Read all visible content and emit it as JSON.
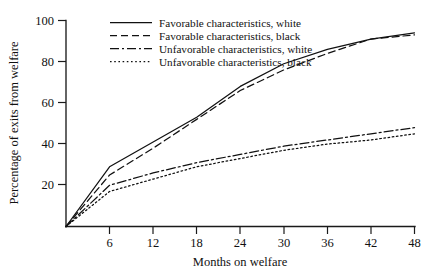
{
  "chart_data": {
    "type": "line",
    "title": "",
    "subtitle": "",
    "xlabel": "Months on welfare",
    "ylabel": "Percentage of exits from welfare",
    "x": [
      0,
      6,
      12,
      18,
      24,
      30,
      36,
      42,
      48
    ],
    "xticks": [
      6,
      12,
      18,
      24,
      30,
      36,
      42,
      48
    ],
    "yticks": [
      20,
      40,
      60,
      80,
      100
    ],
    "xlim": [
      0,
      48
    ],
    "ylim": [
      0,
      100
    ],
    "grid": false,
    "legend_position": "top-left-inside",
    "series": [
      {
        "name": "Favorable characteristics, white",
        "dash": "solid",
        "values": [
          0,
          29,
          41,
          53,
          68,
          79,
          86,
          91,
          94
        ]
      },
      {
        "name": "Favorable characteristics, black",
        "dash": "dashed",
        "values": [
          0,
          25,
          38,
          52,
          66,
          76,
          84,
          91,
          93
        ]
      },
      {
        "name": "Unfavorable characteristics, white",
        "dash": "dash-dot",
        "values": [
          0,
          20,
          26,
          31,
          35,
          39,
          42,
          45,
          48
        ]
      },
      {
        "name": "Unfavorable characteristics, black",
        "dash": "dotted",
        "values": [
          0,
          17,
          23,
          29,
          33,
          37,
          40,
          42,
          45
        ]
      }
    ]
  },
  "axes": {
    "y_title": "Percentage of exits from welfare",
    "x_title": "Months on welfare",
    "y_tick_labels": [
      "100",
      "80",
      "60",
      "40",
      "20"
    ],
    "x_tick_labels": [
      "6",
      "12",
      "18",
      "24",
      "30",
      "36",
      "42",
      "48"
    ]
  },
  "legend": {
    "items": [
      {
        "label": "Favorable characteristics, white"
      },
      {
        "label": "Favorable characteristics, black"
      },
      {
        "label": "Unfavorable characteristics, white"
      },
      {
        "label": "Unfavorable characteristics, black"
      }
    ]
  },
  "colors": {
    "ink": "#111111",
    "background": "#ffffff"
  }
}
